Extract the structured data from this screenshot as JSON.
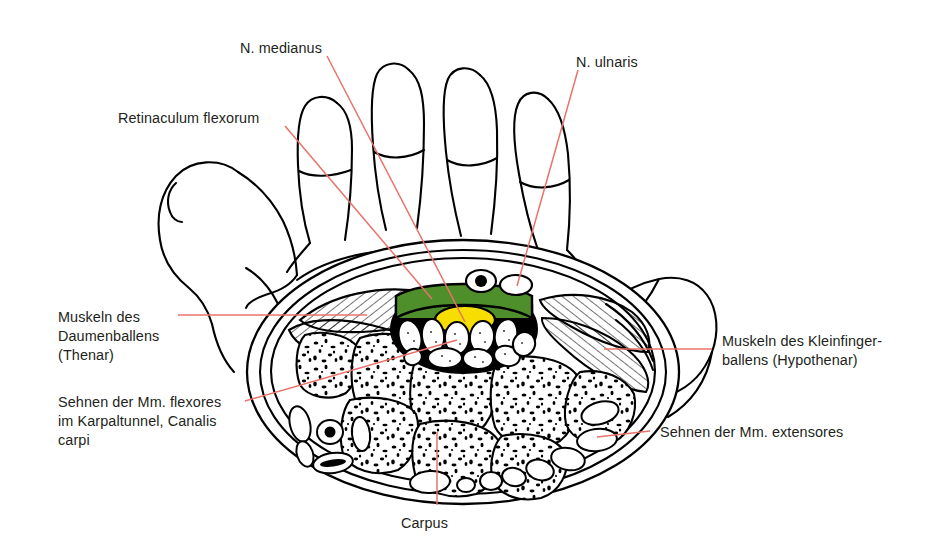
{
  "figure": {
    "background_color": "#ffffff",
    "outline_color": "#000000",
    "leader_color": "#e8736a",
    "text_color": "#231f20"
  },
  "labels": {
    "n_medianus": "N. medianus",
    "n_ulnaris": "N. ulnaris",
    "retinaculum_flexorum": "Retinaculum flexorum",
    "thenar_line1": "Muskeln des",
    "thenar_line2": "Daumenballens",
    "thenar_line3": "(Thenar)",
    "hypothenar_line1": "Muskeln des Kleinfinger-",
    "hypothenar_line2": "ballens (Hypothenar)",
    "flexores_line1": "Sehnen der Mm. flexores",
    "flexores_line2": "im Karpaltunnel, Canalis",
    "flexores_line3": "carpi",
    "extensores": "Sehnen der Mm. extensores",
    "carpus": "Carpus"
  },
  "structures": {
    "retinaculum_color": "#4f8f2b",
    "median_nerve_color": "#f5de00",
    "tunnel_fill_color": "#000000",
    "tendon_fill_color": "#ffffff",
    "bone_fill_color": "#ffffff",
    "muscle_hatch_color": "#000000",
    "items": [
      {
        "name": "retinaculum-flexorum",
        "color": "#4f8f2b",
        "description": "Flexor retinaculum band over carpal tunnel"
      },
      {
        "name": "n-medianus",
        "color": "#f5de00",
        "description": "Median nerve inside carpal tunnel"
      },
      {
        "name": "flexor-tendons",
        "color": "#ffffff",
        "count": 11,
        "description": "Flexor tendons in carpal tunnel"
      },
      {
        "name": "n-ulnaris",
        "color": "#ffffff",
        "description": "Ulnar nerve in Guyon canal"
      },
      {
        "name": "a-ulnaris",
        "color": "#000000",
        "description": "Ulnar artery"
      },
      {
        "name": "thenar-muscles",
        "description": "Hatched thenar muscle mass"
      },
      {
        "name": "hypothenar-muscles",
        "description": "Hatched hypothenar muscle mass"
      },
      {
        "name": "carpal-bones",
        "count": 7,
        "description": "Speckled carpal bones"
      },
      {
        "name": "extensor-tendons",
        "count": 9,
        "description": "Dorsal extensor tendons"
      }
    ]
  }
}
